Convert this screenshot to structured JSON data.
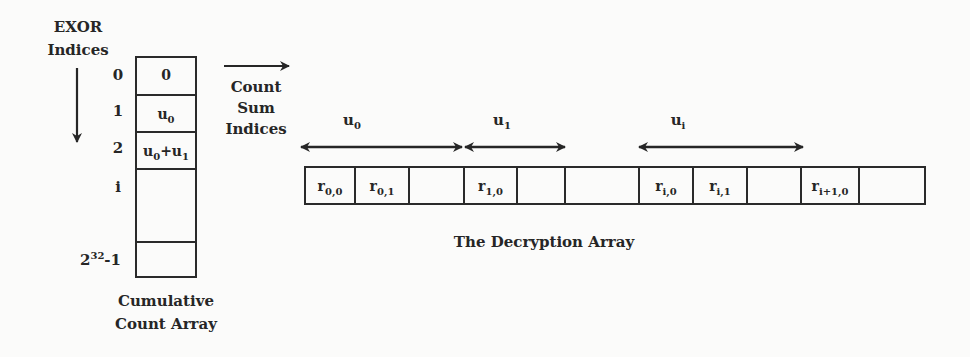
{
  "left_panel": {
    "axis_label_line1": "EXOR",
    "axis_label_line2": "Indices",
    "row_indices": [
      "0",
      "1",
      "2",
      "i",
      "2^32-1"
    ],
    "row_index_last": {
      "base": "2",
      "exp": "32",
      "suffix": "-1"
    },
    "cells": [
      {
        "text": "0"
      },
      {
        "base": "u",
        "sub": "0"
      },
      {
        "expr": [
          {
            "base": "u",
            "sub": "0"
          },
          {
            "op": "+"
          },
          {
            "base": "u",
            "sub": "1"
          }
        ]
      },
      {
        "text": ""
      },
      {
        "text": ""
      }
    ],
    "cell_u0": {
      "base": "u",
      "sub": "0"
    },
    "cell_u0u1": {
      "a_base": "u",
      "a_sub": "0",
      "op": "+",
      "b_base": "u",
      "b_sub": "1"
    },
    "caption_line1": "Cumulative",
    "caption_line2": "Count Array"
  },
  "connector": {
    "label_line1": "Count",
    "label_line2": "Sum",
    "label_line3": "Indices"
  },
  "decryption_array": {
    "caption": "The Decryption Array",
    "spans": [
      {
        "base": "u",
        "sub": "0"
      },
      {
        "base": "u",
        "sub": "1"
      },
      {
        "base": "u",
        "sub": "i"
      }
    ],
    "cells": [
      {
        "base": "r",
        "sub": "0,0"
      },
      {
        "base": "r",
        "sub": "0,1"
      },
      {
        "base": "",
        "sub": ""
      },
      {
        "base": "r",
        "sub": "1,0"
      },
      {
        "base": "",
        "sub": ""
      },
      {
        "base": "",
        "sub": ""
      },
      {
        "base": "r",
        "sub": "i,0"
      },
      {
        "base": "r",
        "sub": "i,1"
      },
      {
        "base": "",
        "sub": ""
      },
      {
        "base": "r",
        "sub": "i+1,0"
      },
      {
        "base": "",
        "sub": ""
      }
    ]
  },
  "colors": {
    "background": "#fbfbfa",
    "ink": "#262626"
  }
}
